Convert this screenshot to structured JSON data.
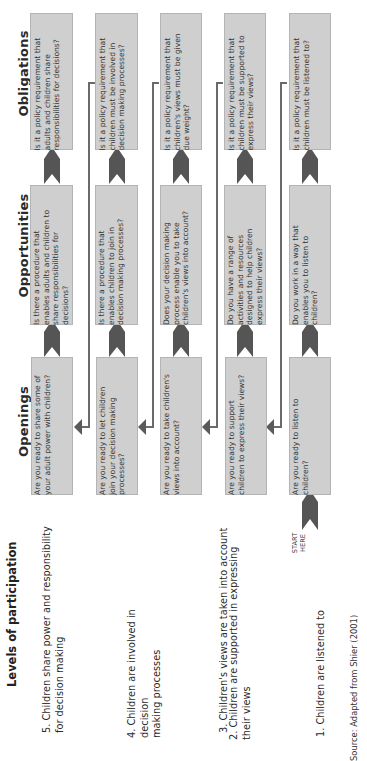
{
  "diagram": {
    "orientation": "rotated 90 degrees counterclockwise",
    "title": "Levels of participation",
    "column_headers": {
      "openings": "Openings",
      "opportunities": "Opportunities",
      "obligations": "Obligations"
    },
    "levels": [
      {
        "level": "5. Children share power and responsibility\nfor decision making",
        "openings": "Are you ready to share some of\nyour adult power with children?",
        "opportunities": "Is there a procedure that\nenables adults and children to\nshare responsibilities for\ndecisions?",
        "obligations": "Is it a policy requirement that\nadults and children share\nresponsibilities for decisions?"
      },
      {
        "level": "4. Children are involved in decision\nmaking processes",
        "openings": "Are you ready to let children\njoin your decision making\nprocesses?",
        "opportunities": "Is there a procedure that\nenables children to join in\ndecision making processes?",
        "obligations": "Is it a policy requirement that\nchildren must be involved in\ndecision making processes?"
      },
      {
        "level": "3. Children's views are taken into account",
        "openings": "Are you ready to take children's\nviews into account?",
        "opportunities": "Does your decision making\nprocess enable you to take\nchildren's views into account?",
        "obligations": "Is it a policy requirement that\nchildren's views must be given\ndue weight?"
      },
      {
        "level": "2. Children are supported in expressing\ntheir views",
        "openings": "Are you ready to support\nchildren to express their views?",
        "opportunities": "Do you have a range of\nactivities and resources\ndesigned to help children\nexpress their views?",
        "obligations": "Is it a policy requirement that\nchildren must be supported to\nexpress their views?"
      },
      {
        "level": "1. Children are listened to",
        "openings": "Are you ready to listen to\nchildren?",
        "opportunities": "Do you work in a way that\nenables you to listen to\nchildren?",
        "obligations": "Is it a policy requirement that\nchildren must be listened to?"
      }
    ],
    "start_label": "START\nHERE",
    "source": "Source: Adapted from Shier (2001)",
    "colors": {
      "box_fill": "#cfcfcf",
      "box_border": "#b4b4b4",
      "arrow": "#5a5a5a",
      "connector": "#6a6a6a",
      "text": "#2a2a2a"
    }
  }
}
